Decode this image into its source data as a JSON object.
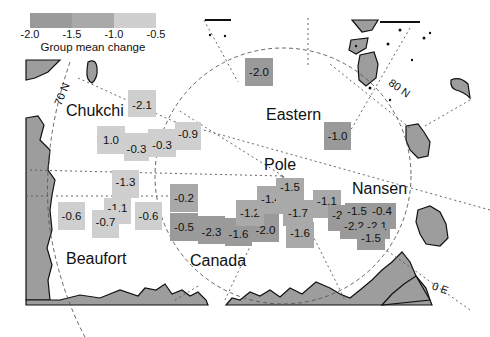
{
  "legend": {
    "title": "Group mean change",
    "ticks": [
      "-2.0",
      "-1.5",
      "-1.0",
      "-0.5"
    ],
    "colors": [
      "#9a9a9a",
      "#a9a9a9",
      "#cfcfcf"
    ]
  },
  "colors": {
    "dark": "#9a9a9a",
    "mid": "#a9a9a9",
    "light": "#cfcfcf",
    "land": "#9d9d9d",
    "land_outline": "#111111",
    "grid": "#555555"
  },
  "labels": {
    "regions": {
      "chukchi": "Chukchi",
      "eastern": "Eastern",
      "pole": "Pole",
      "nansen": "Nansen",
      "beaufort": "Beaufort",
      "canada": "Canada"
    },
    "lat_70": "70 N",
    "lat_80": "80 N",
    "lon_0": "0 E"
  },
  "cells": {
    "chukchi_1": "-2.1",
    "chukchi_2": "1.0",
    "chukchi_3": "-0.3",
    "chukchi_4": "-0.3",
    "chukchi_5": "-0.9",
    "eastern_1": "-2.0",
    "eastern_2": "-1.0",
    "beaufort_1": "-1.3",
    "beaufort_2": "-0.6",
    "beaufort_3": "-1.1",
    "beaufort_4": "-0.7",
    "beaufort_5": "-0.6",
    "canada_1": "-0.2",
    "canada_2": "-0.5",
    "canada_3": "-2.3",
    "canada_4": "-1.6",
    "canada_5": "-2.0",
    "canada_6": "-1.2",
    "pole_1": "-1.4",
    "pole_2": "-1.5",
    "pole_3": "-1.7",
    "pole_4": "-1.6",
    "pole_5": "-1.1",
    "nansen_1": "-2.3",
    "nansen_2": "-1.5",
    "nansen_3": "-0.4",
    "nansen_4": "-2.2",
    "nansen_5": "-2.1",
    "nansen_6": "-1.5"
  }
}
